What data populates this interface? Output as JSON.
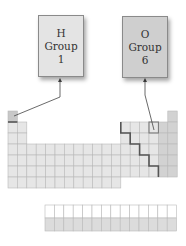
{
  "callouts": [
    {
      "symbol": "H",
      "group_label": "Group",
      "group_number": "1",
      "bg": "#e4e4e4"
    },
    {
      "symbol": "O",
      "group_label": "Group",
      "group_number": "6",
      "bg": "#cfcfcf"
    }
  ],
  "periodic_table": {
    "periods": 7,
    "groups": 18,
    "f_block_rows": 2,
    "f_block_columns": 14,
    "highlighted_cells": [
      "H (period 1, group 1)",
      "O (period 2, group 16)"
    ],
    "metalloid_staircase": true
  },
  "colors": {
    "cell_fill": "#e6e6e6",
    "cell_fill_dark": "#d2d2d2",
    "grid_line": "#b9b9b9",
    "staircase": "#555555",
    "arrow": "#444444"
  }
}
